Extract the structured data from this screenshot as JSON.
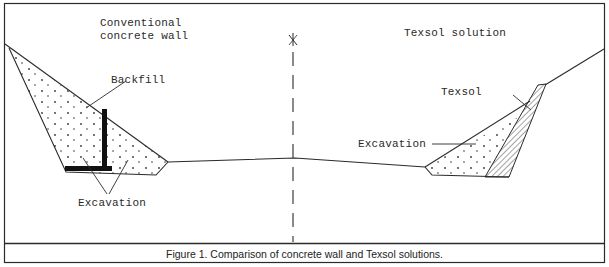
{
  "figure": {
    "caption": "Figure 1.   Comparison of concrete wall and Texsol   solutions.",
    "left_panel": {
      "title_line1": "Conventional",
      "title_line2": "concrete wall",
      "labels": {
        "backfill": "Backfill",
        "excavation": "Excavation"
      }
    },
    "right_panel": {
      "title": "Texsol solution",
      "labels": {
        "texsol": "Texsol",
        "excavation": "Excavation"
      }
    },
    "centerline_symbol": "centerline-symbol",
    "colors": {
      "line": "#2a2a2a",
      "wall": "#111111",
      "background": "#ffffff"
    }
  }
}
